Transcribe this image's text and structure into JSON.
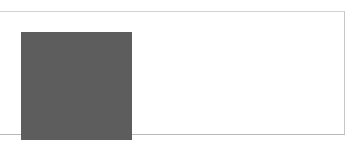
{
  "page": {
    "background_color": "#ffffff",
    "width": 359,
    "height": 147
  },
  "panel": {
    "name": "image-panel",
    "border_color": "#d2d2d2",
    "background_color": "#ffffff",
    "bounds": {
      "x": -2,
      "y": 11,
      "width": 347,
      "height": 124
    }
  },
  "noise_image": {
    "alt_text": "",
    "kind": "random-grayscale-noise",
    "bounds": {
      "x": 22,
      "y": 20,
      "width": 111,
      "height": 108
    },
    "grain_px": 1,
    "mean_gray": "#5d5d5d",
    "min_gray": "#0a0a0a",
    "max_gray": "#d8d8d8",
    "seed": 20240517
  },
  "empty_area": {
    "name": "blank-content-area",
    "background_color": "#ffffff",
    "text": ""
  }
}
